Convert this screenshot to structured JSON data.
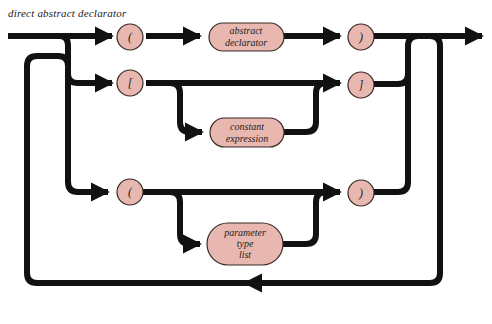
{
  "title": "direct abstract declarator",
  "colors": {
    "line": "#111111",
    "node_fill": "#e8b8b0",
    "node_stroke": "#3a2a28",
    "background": "#ffffff"
  },
  "nodes": {
    "open_paren_top": {
      "label": "(",
      "shape": "circle"
    },
    "abstract_declarator": {
      "label_line1": "abstract",
      "label_line2": "declarator",
      "shape": "rounded-rect"
    },
    "close_paren_top": {
      "label": ")",
      "shape": "circle"
    },
    "open_bracket": {
      "label": "[",
      "shape": "circle"
    },
    "constant_expression": {
      "label_line1": "constant",
      "label_line2": "expression",
      "shape": "rounded-rect"
    },
    "close_bracket": {
      "label": "]",
      "shape": "circle"
    },
    "open_paren_bottom": {
      "label": "(",
      "shape": "circle"
    },
    "parameter_type_list": {
      "label_line1": "parameter",
      "label_line2": "type",
      "label_line3": "list",
      "shape": "rounded-rect"
    },
    "close_paren_bottom": {
      "label": ")",
      "shape": "circle"
    }
  }
}
